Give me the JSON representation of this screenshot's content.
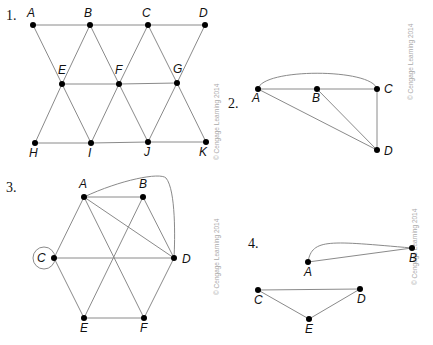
{
  "figures": [
    {
      "number": "1.",
      "copyright": "© Cengage Learning 2014",
      "vertices": [
        "A",
        "B",
        "C",
        "D",
        "E",
        "F",
        "G",
        "H",
        "I",
        "J",
        "K"
      ],
      "edges": [
        [
          "A",
          "B"
        ],
        [
          "B",
          "C"
        ],
        [
          "C",
          "D"
        ],
        [
          "A",
          "E"
        ],
        [
          "E",
          "I"
        ],
        [
          "B",
          "E"
        ],
        [
          "B",
          "F"
        ],
        [
          "F",
          "J"
        ],
        [
          "C",
          "F"
        ],
        [
          "C",
          "G"
        ],
        [
          "G",
          "K"
        ],
        [
          "D",
          "G"
        ],
        [
          "E",
          "F"
        ],
        [
          "F",
          "G"
        ],
        [
          "E",
          "H"
        ],
        [
          "H",
          "I"
        ],
        [
          "I",
          "J"
        ],
        [
          "J",
          "K"
        ],
        [
          "I",
          "F"
        ],
        [
          "J",
          "G"
        ]
      ]
    },
    {
      "number": "2.",
      "copyright": "© Cengage Learning 2014",
      "vertices": [
        "A",
        "B",
        "C",
        "D"
      ],
      "edges": [
        [
          "A",
          "B"
        ],
        [
          "B",
          "C"
        ],
        [
          "A",
          "C",
          "curved"
        ],
        [
          "A",
          "D"
        ],
        [
          "B",
          "D"
        ],
        [
          "C",
          "D"
        ]
      ]
    },
    {
      "number": "3.",
      "copyright": "© Cengage Learning 2014",
      "vertices": [
        "A",
        "B",
        "C",
        "D",
        "E",
        "F"
      ],
      "edges": [
        [
          "A",
          "B"
        ],
        [
          "A",
          "C"
        ],
        [
          "A",
          "D"
        ],
        [
          "A",
          "D",
          "curved"
        ],
        [
          "A",
          "F"
        ],
        [
          "B",
          "D"
        ],
        [
          "B",
          "E"
        ],
        [
          "C",
          "D"
        ],
        [
          "C",
          "E"
        ],
        [
          "C",
          "C",
          "loop"
        ],
        [
          "D",
          "F"
        ],
        [
          "E",
          "F"
        ]
      ]
    },
    {
      "number": "4.",
      "copyright": "© Cengage Learning 2014",
      "vertices": [
        "A",
        "B",
        "C",
        "D",
        "E"
      ],
      "edges": [
        [
          "A",
          "B"
        ],
        [
          "A",
          "B",
          "curved"
        ],
        [
          "C",
          "D"
        ],
        [
          "C",
          "E"
        ],
        [
          "D",
          "E"
        ]
      ]
    }
  ]
}
